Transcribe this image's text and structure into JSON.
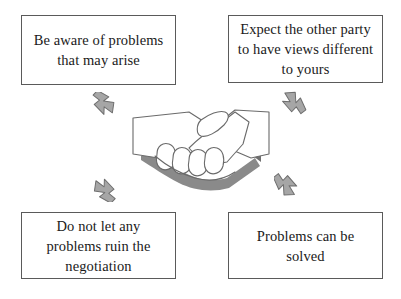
{
  "diagram": {
    "background_color": "#ffffff",
    "box_border_color": "#5a5a5a",
    "text_color": "#1a1a1a",
    "arrow_fill_color": "#a6a6a6",
    "arrow_stroke_color": "#6e6e6e",
    "shadow_color": "#888888",
    "boxes": [
      {
        "id": "top-left",
        "text": "Be aware of problems that may arise",
        "lines": [
          "Be aware of",
          "problems that",
          "may arise"
        ]
      },
      {
        "id": "top-right",
        "text": "Expect the other party to have views different to yours",
        "lines": [
          "Expect the other",
          "party to have views",
          "different to yours"
        ]
      },
      {
        "id": "bottom-left",
        "text": "Do not let any problems ruin the negotiation",
        "lines": [
          "Do not let any",
          "problems ruin the",
          "negotiation"
        ]
      },
      {
        "id": "bottom-right",
        "text": "Problems can be solved",
        "lines": [
          "Problems can be",
          "solved"
        ]
      }
    ],
    "arrows": [
      {
        "id": "top-left",
        "direction": "down-right",
        "points_to": "handshake"
      },
      {
        "id": "top-right",
        "direction": "down-left",
        "points_to": "handshake"
      },
      {
        "id": "bottom-left",
        "direction": "up-right",
        "points_to": "handshake"
      },
      {
        "id": "bottom-right",
        "direction": "up-left",
        "points_to": "handshake"
      }
    ],
    "center_image": {
      "name": "handshake-illustration",
      "description": "Line drawing of two hands clasped in a handshake with gray drop shadow"
    }
  }
}
